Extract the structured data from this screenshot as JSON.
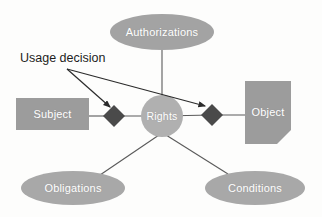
{
  "diagram": {
    "background_color": "#fdfdfc",
    "annotations": [
      {
        "id": "usage-decision",
        "text": "Usage decision",
        "color": "#1d1d1d",
        "x": 20,
        "y": 51,
        "points_to": [
          "subject-rights-diamond",
          "rights-object-diamond"
        ]
      }
    ],
    "nodes": [
      {
        "id": "authorizations",
        "label": "Authorizations",
        "shape": "ellipse",
        "fill": "#a3a3a3",
        "text_color": "#ffffff",
        "cx": 162,
        "cy": 32,
        "rx": 52,
        "ry": 18
      },
      {
        "id": "subject",
        "label": "Subject",
        "shape": "rectangle",
        "fill": "#9c9c9c",
        "text_color": "#ffffff",
        "x": 16,
        "y": 98,
        "width": 73,
        "height": 32
      },
      {
        "id": "rights",
        "label": "Rights",
        "shape": "circle",
        "fill": "#b0b0b0",
        "text_color": "#ffffff",
        "cx": 162,
        "cy": 116,
        "r": 21
      },
      {
        "id": "object",
        "label": "Object",
        "shape": "document-cut-corner",
        "fill": "#9c9c9c",
        "text_color": "#ffffff",
        "x": 245,
        "y": 81,
        "width": 46,
        "height": 63,
        "corner_cut": 14
      },
      {
        "id": "obligations",
        "label": "Obligations",
        "shape": "ellipse",
        "fill": "#a8a8a8",
        "text_color": "#ffffff",
        "cx": 73,
        "cy": 188,
        "rx": 52,
        "ry": 17
      },
      {
        "id": "conditions",
        "label": "Conditions",
        "shape": "ellipse",
        "fill": "#a8a8a8",
        "text_color": "#ffffff",
        "cx": 255,
        "cy": 188,
        "rx": 50,
        "ry": 17
      }
    ],
    "decision_points": [
      {
        "id": "subject-rights-diamond",
        "shape": "diamond",
        "fill": "#4a4a4a",
        "cx": 114,
        "cy": 116,
        "size": 11
      },
      {
        "id": "rights-object-diamond",
        "shape": "diamond",
        "fill": "#4a4a4a",
        "cx": 212,
        "cy": 115,
        "size": 11
      }
    ],
    "connectors": [
      {
        "id": "authorizations-to-rights",
        "from": "authorizations",
        "to": "rights",
        "style": "line"
      },
      {
        "id": "subject-to-diamond",
        "from": "subject",
        "to": "subject-rights-diamond",
        "style": "line"
      },
      {
        "id": "diamond-to-rights",
        "from": "subject-rights-diamond",
        "to": "rights",
        "style": "line"
      },
      {
        "id": "rights-to-diamond",
        "from": "rights",
        "to": "rights-object-diamond",
        "style": "line"
      },
      {
        "id": "diamond-to-object",
        "from": "rights-object-diamond",
        "to": "object",
        "style": "line"
      },
      {
        "id": "rights-to-obligations",
        "from": "rights",
        "to": "obligations",
        "style": "line"
      },
      {
        "id": "rights-to-conditions",
        "from": "rights",
        "to": "conditions",
        "style": "line"
      }
    ],
    "arrows": [
      {
        "id": "usage-decision-arrow-left",
        "from_point": [
          67,
          69
        ],
        "to_point": [
          110,
          108
        ],
        "style": "solid-arrowhead"
      },
      {
        "id": "usage-decision-arrow-right",
        "from_point": [
          67,
          69
        ],
        "to_point": [
          207,
          107
        ],
        "style": "solid-arrowhead"
      }
    ],
    "line_color": "#5a5a5a"
  }
}
